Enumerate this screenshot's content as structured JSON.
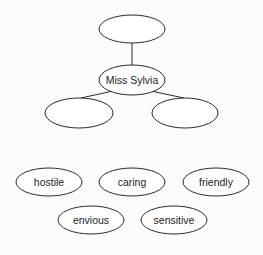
{
  "diagram": {
    "type": "character web",
    "nodes": [
      {
        "id": "top",
        "label": "",
        "cx": 132,
        "cy": 29,
        "rx": 33,
        "ry": 14
      },
      {
        "id": "center",
        "label": "Miss Sylvia",
        "cx": 132,
        "cy": 80,
        "rx": 33,
        "ry": 15
      },
      {
        "id": "left",
        "label": "",
        "cx": 79,
        "cy": 113,
        "rx": 34,
        "ry": 15
      },
      {
        "id": "right",
        "label": "",
        "cx": 185,
        "cy": 113,
        "rx": 33,
        "ry": 15
      }
    ],
    "edges": [
      {
        "from": "center",
        "to": "top"
      },
      {
        "from": "center",
        "to": "left"
      },
      {
        "from": "center",
        "to": "right"
      }
    ],
    "word_bank": [
      {
        "label": "hostile",
        "cx": 49,
        "cy": 182,
        "rx": 33,
        "ry": 14
      },
      {
        "label": "caring",
        "cx": 132,
        "cy": 182,
        "rx": 33,
        "ry": 14
      },
      {
        "label": "friendly",
        "cx": 216,
        "cy": 182,
        "rx": 33,
        "ry": 14
      },
      {
        "label": "envious",
        "cx": 91,
        "cy": 220,
        "rx": 33,
        "ry": 14
      },
      {
        "label": "sensitive",
        "cx": 174,
        "cy": 220,
        "rx": 33,
        "ry": 14
      }
    ]
  }
}
